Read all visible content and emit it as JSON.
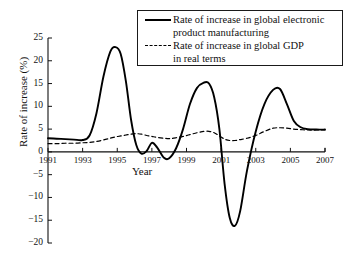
{
  "chart_data": {
    "type": "line",
    "title": "",
    "xlabel": "Year",
    "ylabel": "Rate of increase (%)",
    "xlim": [
      1991,
      2007
    ],
    "ylim": [
      -20,
      25
    ],
    "ytick_labels": [
      "25",
      "20",
      "15",
      "10",
      "5",
      "0",
      "−5",
      "−10",
      "−15",
      "−20"
    ],
    "ytick_values": [
      25,
      20,
      15,
      10,
      5,
      0,
      -5,
      -10,
      -15,
      -20
    ],
    "xtick_labels": [
      "1991",
      "1993",
      "1995",
      "1997",
      "1999",
      "2001",
      "2003",
      "2005",
      "2007"
    ],
    "xtick_values": [
      1991,
      1993,
      1995,
      1997,
      1999,
      2001,
      2003,
      2005,
      2007
    ],
    "grid": false,
    "legend_position": "top-right",
    "x": [
      1991.0,
      1991.5,
      1992.0,
      1992.5,
      1993.0,
      1993.4,
      1993.8,
      1994.2,
      1994.6,
      1994.9,
      1995.2,
      1995.5,
      1995.8,
      1996.1,
      1996.4,
      1996.7,
      1997.0,
      1997.3,
      1997.7,
      1998.0,
      1998.4,
      1998.8,
      1999.2,
      1999.6,
      2000.0,
      2000.3,
      2000.6,
      2000.9,
      2001.2,
      2001.5,
      2001.8,
      2002.1,
      2002.5,
      2003.0,
      2003.5,
      2004.0,
      2004.4,
      2004.8,
      2005.2,
      2005.6,
      2006.0,
      2006.5,
      2007.0
    ],
    "series": [
      {
        "name": "Rate of increase in global electronic product manufacturing",
        "style": "solid",
        "color": "#000000",
        "values": [
          3.0,
          2.9,
          2.8,
          2.7,
          2.6,
          3.6,
          8.5,
          16.5,
          22.0,
          23.0,
          21.5,
          15.5,
          7.0,
          1.5,
          -0.4,
          0.2,
          2.0,
          1.0,
          -1.3,
          -1.4,
          0.8,
          5.0,
          10.5,
          14.0,
          15.2,
          15.0,
          12.0,
          5.0,
          -7.0,
          -14.5,
          -16.2,
          -13.0,
          -4.0,
          4.5,
          10.5,
          13.6,
          13.8,
          10.5,
          6.8,
          5.4,
          5.0,
          4.9,
          4.9
        ]
      },
      {
        "name": "Rate of increase in global GDP in real terms",
        "style": "dashed",
        "color": "#000000",
        "values": [
          1.8,
          1.8,
          1.9,
          1.9,
          2.0,
          2.1,
          2.3,
          2.6,
          3.0,
          3.3,
          3.5,
          3.7,
          3.9,
          4.0,
          3.9,
          3.6,
          3.4,
          3.2,
          3.0,
          2.9,
          3.1,
          3.4,
          3.8,
          4.2,
          4.5,
          4.5,
          4.2,
          3.5,
          2.8,
          2.5,
          2.5,
          2.7,
          3.0,
          3.6,
          4.5,
          5.2,
          5.3,
          5.2,
          5.0,
          4.9,
          4.8,
          4.8,
          4.8
        ]
      }
    ]
  },
  "legend": {
    "items": [
      {
        "label": "Rate of increase in global electronic\nproduct manufacturing",
        "style": "solid"
      },
      {
        "label": "Rate of increase in global GDP\nin real terms",
        "style": "dashed"
      }
    ]
  }
}
